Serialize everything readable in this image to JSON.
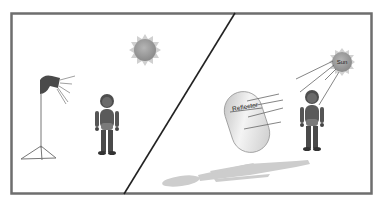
{
  "diagram": {
    "colors": {
      "frame": "#6e6e6e",
      "figure": "#555555",
      "sun": "#9a9a9a",
      "shadow": "#c8c8c8",
      "reflector": "#d8d8d8"
    },
    "left_panel": {
      "description": "Studio light on stand lighting a figure; sun in background",
      "elements": [
        "sun-icon",
        "studio-light-icon",
        "light-stand",
        "person-figure"
      ]
    },
    "right_panel": {
      "description": "Sun lighting a figure, reflector bouncing light back, long cast shadow",
      "sun_label": "Sun",
      "reflector_label": "Reflector",
      "elements": [
        "sun-icon",
        "reflector",
        "person-figure",
        "shadow"
      ]
    }
  }
}
